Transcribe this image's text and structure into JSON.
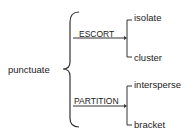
{
  "diagram": {
    "root": "punctuate",
    "branches": [
      {
        "label": "ESCORT",
        "children": [
          "isolate",
          "cluster"
        ]
      },
      {
        "label": "PARTITION",
        "children": [
          "intersperse",
          "bracket"
        ]
      }
    ]
  }
}
